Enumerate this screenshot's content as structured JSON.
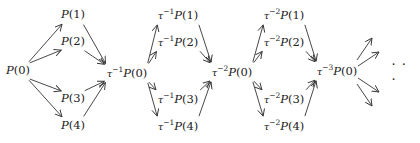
{
  "diagram": {
    "type": "auslander-reiten-quiver",
    "nodes": [
      {
        "id": "P0",
        "tau": "",
        "base": "P",
        "arg": "(0)",
        "x": 18,
        "y": 71
      },
      {
        "id": "P1",
        "tau": "",
        "base": "P",
        "arg": "(1)",
        "x": 73,
        "y": 15
      },
      {
        "id": "P2",
        "tau": "",
        "base": "P",
        "arg": "(2)",
        "x": 73,
        "y": 42
      },
      {
        "id": "P3",
        "tau": "",
        "base": "P",
        "arg": "(3)",
        "x": 73,
        "y": 99
      },
      {
        "id": "P4",
        "tau": "",
        "base": "P",
        "arg": "(4)",
        "x": 73,
        "y": 126
      },
      {
        "id": "t1P0",
        "tau": "−1",
        "base": "P",
        "arg": "(0)",
        "x": 127,
        "y": 73
      },
      {
        "id": "t1P1",
        "tau": "−1",
        "base": "P",
        "arg": "(1)",
        "x": 178,
        "y": 15
      },
      {
        "id": "t1P2",
        "tau": "−1",
        "base": "P",
        "arg": "(2)",
        "x": 178,
        "y": 42
      },
      {
        "id": "t1P3",
        "tau": "−1",
        "base": "P",
        "arg": "(3)",
        "x": 178,
        "y": 99
      },
      {
        "id": "t1P4",
        "tau": "−1",
        "base": "P",
        "arg": "(4)",
        "x": 178,
        "y": 126
      },
      {
        "id": "t2P0",
        "tau": "−2",
        "base": "P",
        "arg": "(0)",
        "x": 232,
        "y": 72
      },
      {
        "id": "t2P1",
        "tau": "−2",
        "base": "P",
        "arg": "(1)",
        "x": 284,
        "y": 15
      },
      {
        "id": "t2P2",
        "tau": "−2",
        "base": "P",
        "arg": "(2)",
        "x": 284,
        "y": 42
      },
      {
        "id": "t2P3",
        "tau": "−2",
        "base": "P",
        "arg": "(3)",
        "x": 284,
        "y": 99
      },
      {
        "id": "t2P4",
        "tau": "−2",
        "base": "P",
        "arg": "(4)",
        "x": 284,
        "y": 126
      },
      {
        "id": "t3P0",
        "tau": "−3",
        "base": "P",
        "arg": "(0)",
        "x": 337,
        "y": 71
      }
    ],
    "tau_symbol": "τ",
    "ellipsis": "· · ·",
    "ellipsis_pos": {
      "x": 401,
      "y": 72
    },
    "edges": [
      [
        "P0",
        "P1"
      ],
      [
        "P0",
        "P2"
      ],
      [
        "P0",
        "P3"
      ],
      [
        "P0",
        "P4"
      ],
      [
        "P1",
        "t1P0"
      ],
      [
        "P2",
        "t1P0"
      ],
      [
        "P3",
        "t1P0"
      ],
      [
        "P4",
        "t1P0"
      ],
      [
        "t1P0",
        "t1P1"
      ],
      [
        "t1P0",
        "t1P2"
      ],
      [
        "t1P0",
        "t1P3"
      ],
      [
        "t1P0",
        "t1P4"
      ],
      [
        "t1P1",
        "t2P0"
      ],
      [
        "t1P2",
        "t2P0"
      ],
      [
        "t1P3",
        "t2P0"
      ],
      [
        "t1P4",
        "t2P0"
      ],
      [
        "t2P0",
        "t2P1"
      ],
      [
        "t2P0",
        "t2P2"
      ],
      [
        "t2P0",
        "t2P3"
      ],
      [
        "t2P0",
        "t2P4"
      ],
      [
        "t2P1",
        "t3P0"
      ],
      [
        "t2P2",
        "t3P0"
      ],
      [
        "t2P3",
        "t3P0"
      ],
      [
        "t2P4",
        "t3P0"
      ]
    ],
    "open_edges": [
      {
        "from": [
          357,
          60
        ],
        "to": [
          372,
          38
        ]
      },
      {
        "from": [
          358,
          66
        ],
        "to": [
          379,
          52
        ]
      },
      {
        "from": [
          358,
          78
        ],
        "to": [
          379,
          92
        ]
      },
      {
        "from": [
          357,
          84
        ],
        "to": [
          372,
          106
        ]
      }
    ],
    "colors": {
      "stroke": "#333333",
      "text": "#222222"
    }
  }
}
